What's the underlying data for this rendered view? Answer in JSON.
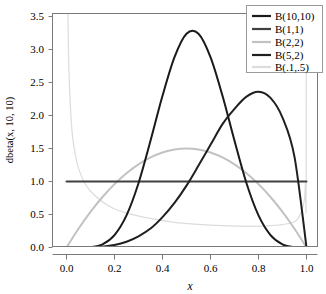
{
  "chart_data": {
    "type": "line",
    "title": "",
    "subtitle": "",
    "xlabel": "x",
    "ylabel": "dbeta(x, 10, 10)",
    "xlim": [
      0,
      1
    ],
    "ylim": [
      0,
      3.6
    ],
    "grid": false,
    "legend_position": "top-right",
    "x_ticks": [
      "0.0",
      "0.2",
      "0.4",
      "0.6",
      "0.8",
      "1.0"
    ],
    "x_tick_values": [
      0.0,
      0.2,
      0.4,
      0.6,
      0.8,
      1.0
    ],
    "y_ticks": [
      "0.0",
      "0.5",
      "1.0",
      "1.5",
      "2.0",
      "2.5",
      "3.0",
      "3.5"
    ],
    "y_tick_values": [
      0.0,
      0.5,
      1.0,
      1.5,
      2.0,
      2.5,
      3.0,
      3.5
    ],
    "series": [
      {
        "name": "B(10,10)",
        "color": "#1a1a1a",
        "width": 2.0,
        "peak_x": 0.5,
        "peak_y": 3.52,
        "x": [
          0.0,
          0.05,
          0.1,
          0.15,
          0.2,
          0.25,
          0.3,
          0.35,
          0.4,
          0.45,
          0.5,
          0.55,
          0.6,
          0.65,
          0.7,
          0.75,
          0.8,
          0.85,
          0.9,
          0.95,
          1.0
        ],
        "values": [
          0.0,
          0.0,
          0.006,
          0.049,
          0.189,
          0.487,
          0.974,
          1.617,
          2.298,
          2.885,
          3.24,
          3.24,
          2.885,
          2.298,
          1.617,
          0.974,
          0.487,
          0.189,
          0.049,
          0.006,
          0.0
        ]
      },
      {
        "name": "B(1,1)",
        "color": "#404040",
        "width": 2.0,
        "peak_x": 0.5,
        "peak_y": 1.0,
        "x": [
          0.0,
          0.05,
          0.1,
          0.15,
          0.2,
          0.25,
          0.3,
          0.35,
          0.4,
          0.45,
          0.5,
          0.55,
          0.6,
          0.65,
          0.7,
          0.75,
          0.8,
          0.85,
          0.9,
          0.95,
          1.0
        ],
        "values": [
          1.0,
          1.0,
          1.0,
          1.0,
          1.0,
          1.0,
          1.0,
          1.0,
          1.0,
          1.0,
          1.0,
          1.0,
          1.0,
          1.0,
          1.0,
          1.0,
          1.0,
          1.0,
          1.0,
          1.0,
          1.0
        ]
      },
      {
        "name": "B(2,2)",
        "color": "#c2c2c2",
        "width": 2.0,
        "peak_x": 0.5,
        "peak_y": 1.5,
        "x": [
          0.0,
          0.05,
          0.1,
          0.15,
          0.2,
          0.25,
          0.3,
          0.35,
          0.4,
          0.45,
          0.5,
          0.55,
          0.6,
          0.65,
          0.7,
          0.75,
          0.8,
          0.85,
          0.9,
          0.95,
          1.0
        ],
        "values": [
          0.0,
          0.285,
          0.54,
          0.765,
          0.96,
          1.125,
          1.26,
          1.365,
          1.44,
          1.485,
          1.5,
          1.485,
          1.44,
          1.365,
          1.26,
          1.125,
          0.96,
          0.765,
          0.54,
          0.285,
          0.0
        ]
      },
      {
        "name": "B(5,2)",
        "color": "#1f1f1f",
        "width": 2.0,
        "peak_x": 0.8,
        "peak_y": 2.46,
        "x": [
          0.0,
          0.05,
          0.1,
          0.15,
          0.2,
          0.25,
          0.3,
          0.35,
          0.4,
          0.45,
          0.5,
          0.55,
          0.6,
          0.65,
          0.7,
          0.75,
          0.8,
          0.85,
          0.9,
          0.95,
          1.0
        ],
        "values": [
          0.0,
          0.0,
          0.003,
          0.013,
          0.038,
          0.088,
          0.17,
          0.287,
          0.461,
          0.676,
          0.938,
          1.241,
          1.555,
          1.87,
          2.101,
          2.285,
          2.359,
          2.266,
          1.968,
          1.373,
          0.0
        ]
      },
      {
        "name": "B(.1,.5)",
        "color": "#dcdcdc",
        "width": 1.2,
        "peak_x": 0.0,
        "peak_y": 9.0,
        "note": "density diverges at both endpoints; clipped at top of panel",
        "x": [
          0.001,
          0.003,
          0.006,
          0.01,
          0.02,
          0.03,
          0.05,
          0.08,
          0.12,
          0.18,
          0.25,
          0.35,
          0.45,
          0.55,
          0.65,
          0.75,
          0.85,
          0.92,
          0.96,
          0.985,
          0.995,
          0.999
        ],
        "values": [
          9.0,
          5.0,
          3.55,
          2.7,
          1.9,
          1.55,
          1.2,
          0.95,
          0.78,
          0.62,
          0.52,
          0.44,
          0.38,
          0.35,
          0.33,
          0.32,
          0.33,
          0.36,
          0.42,
          0.62,
          0.95,
          2.3
        ]
      }
    ],
    "annotations": []
  },
  "legend": {
    "entries": [
      {
        "label": "B(10,10)",
        "color": "#1a1a1a"
      },
      {
        "label": "B(1,1)",
        "color": "#404040"
      },
      {
        "label": "B(2,2)",
        "color": "#c2c2c2"
      },
      {
        "label": "B(5,2)",
        "color": "#1f1f1f"
      },
      {
        "label": "B(.1,.5)",
        "color": "#dcdcdc"
      }
    ]
  },
  "axes": {
    "x_title": "x",
    "y_title": "dbeta(x, 10, 10)",
    "x_tick_labels": [
      "0.0",
      "0.2",
      "0.4",
      "0.6",
      "0.8",
      "1.0"
    ],
    "y_tick_labels": [
      "0.0",
      "0.5",
      "1.0",
      "1.5",
      "2.0",
      "2.5",
      "3.0",
      "3.5"
    ]
  }
}
